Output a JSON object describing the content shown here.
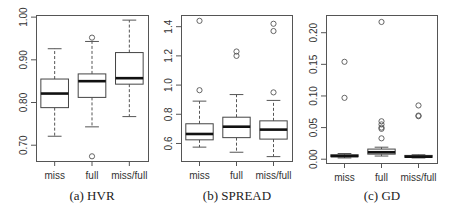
{
  "chart_data": [
    {
      "type": "boxplot",
      "caption": "(a)  HVR",
      "title": "",
      "xlabel": "",
      "ylabel": "",
      "categories": [
        "miss",
        "full",
        "miss/full"
      ],
      "yticks": [
        "0.70",
        "0.80",
        "0.90",
        "1.00"
      ],
      "ytick_values": [
        0.7,
        0.8,
        0.9,
        1.0
      ],
      "ylim": [
        0.663,
        1.005
      ],
      "grid": false,
      "boxes": [
        {
          "name": "miss",
          "whisker_low": 0.721,
          "q1": 0.788,
          "median": 0.821,
          "q3": 0.855,
          "whisker_high": 0.926,
          "outliers": []
        },
        {
          "name": "full",
          "whisker_low": 0.743,
          "q1": 0.812,
          "median": 0.85,
          "q3": 0.867,
          "whisker_high": 0.943,
          "outliers": [
            0.952,
            0.674
          ]
        },
        {
          "name": "miss/full",
          "whisker_low": 0.767,
          "q1": 0.843,
          "median": 0.857,
          "q3": 0.917,
          "whisker_high": 0.993,
          "outliers": []
        }
      ]
    },
    {
      "type": "boxplot",
      "caption": "(b)  SPREAD",
      "title": "",
      "xlabel": "",
      "ylabel": "",
      "categories": [
        "miss",
        "full",
        "miss/full"
      ],
      "yticks": [
        "0.6",
        "0.8",
        "1.0",
        "1.2",
        "1.4"
      ],
      "ytick_values": [
        0.6,
        0.8,
        1.0,
        1.2,
        1.4
      ],
      "ylim": [
        0.48,
        1.48
      ],
      "grid": false,
      "boxes": [
        {
          "name": "miss",
          "whisker_low": 0.575,
          "q1": 0.625,
          "median": 0.665,
          "q3": 0.735,
          "whisker_high": 0.89,
          "outliers": [
            1.44,
            0.965
          ]
        },
        {
          "name": "full",
          "whisker_low": 0.54,
          "q1": 0.64,
          "median": 0.715,
          "q3": 0.78,
          "whisker_high": 0.935,
          "outliers": [
            1.23,
            1.2
          ]
        },
        {
          "name": "miss/full",
          "whisker_low": 0.51,
          "q1": 0.63,
          "median": 0.695,
          "q3": 0.755,
          "whisker_high": 0.895,
          "outliers": [
            1.42,
            1.37,
            0.95
          ]
        }
      ]
    },
    {
      "type": "boxplot",
      "caption": "(c)  GD",
      "title": "",
      "xlabel": "",
      "ylabel": "",
      "categories": [
        "miss",
        "full",
        "miss/full"
      ],
      "yticks": [
        "0.00",
        "0.05",
        "0.10",
        "0.15",
        "0.20"
      ],
      "ytick_values": [
        0.0,
        0.05,
        0.1,
        0.15,
        0.2
      ],
      "ylim": [
        -0.006,
        0.228
      ],
      "grid": false,
      "boxes": [
        {
          "name": "miss",
          "whisker_low": 0.002,
          "q1": 0.004,
          "median": 0.005,
          "q3": 0.007,
          "whisker_high": 0.009,
          "outliers": [
            0.154,
            0.097
          ]
        },
        {
          "name": "full",
          "whisker_low": 0.005,
          "q1": 0.008,
          "median": 0.011,
          "q3": 0.016,
          "whisker_high": 0.019,
          "outliers": [
            0.217,
            0.06,
            0.055,
            0.05,
            0.048,
            0.033
          ]
        },
        {
          "name": "miss/full",
          "whisker_low": 0.002,
          "q1": 0.003,
          "median": 0.004,
          "q3": 0.006,
          "whisker_high": 0.007,
          "outliers": [
            0.085,
            0.069,
            0.068
          ]
        }
      ]
    }
  ],
  "panels": [
    {
      "caption": "(a)  HVR",
      "x_labels": [
        "miss",
        "full",
        "miss/full"
      ]
    },
    {
      "caption": "(b)  SPREAD",
      "x_labels": [
        "miss",
        "full",
        "miss/full"
      ]
    },
    {
      "caption": "(c)  GD",
      "x_labels": [
        "miss",
        "full",
        "miss/full"
      ]
    }
  ]
}
